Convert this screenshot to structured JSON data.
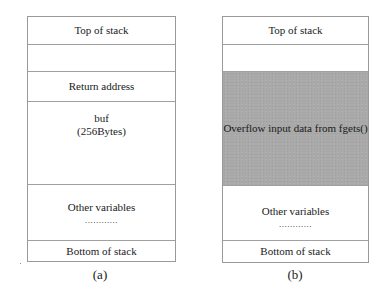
{
  "diagrams": [
    {
      "caption": "(a)",
      "cells": [
        {
          "label": "Top of stack"
        },
        {
          "label": ""
        },
        {
          "label": "Return address"
        },
        {
          "label": "buf",
          "sublabel": "(256Bytes)"
        },
        {
          "label": "Other variables",
          "dots": "............"
        },
        {
          "label": "Bottom of stack"
        }
      ]
    },
    {
      "caption": "(b)",
      "cells": [
        {
          "label": "Top of stack"
        },
        {
          "label": ""
        },
        {
          "label": "Overflow input data from fgets()",
          "fill": "#a9a9a9"
        },
        {
          "label": "Other variables",
          "dots": "............"
        },
        {
          "label": "Bottom of stack"
        }
      ]
    }
  ]
}
